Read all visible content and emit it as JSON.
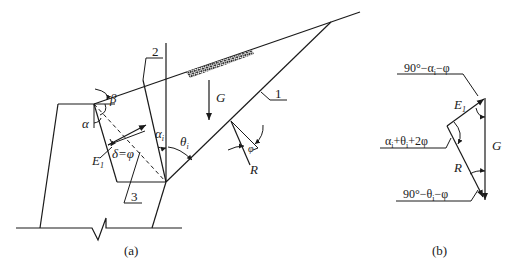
{
  "figure_a": {
    "caption": "(a)",
    "labels": {
      "alpha": "α",
      "beta": "β",
      "alpha_i": "α",
      "alpha_i_sub": "i",
      "theta_i": "θ",
      "theta_i_sub": "i",
      "E1": "E",
      "E1_sub": "1",
      "delta_eq": "δ=φ",
      "G": "G",
      "R": "R",
      "phi": "φ"
    },
    "callouts": {
      "c1": "1",
      "c2": "2",
      "c3": "3"
    }
  },
  "figure_b": {
    "caption": "(b)",
    "labels": {
      "E1": "E",
      "E1_sub": "1",
      "G": "G",
      "R": "R"
    },
    "angles": {
      "top": "90°−α",
      "top_sub": "i",
      "top_tail": "−φ",
      "mid": "α",
      "mid_sub": "i",
      "mid_mid": "+θ",
      "mid_sub2": "i",
      "mid_tail": "+2φ",
      "bottom": "90°−θ",
      "bottom_sub": "i",
      "bottom_tail": "−φ"
    }
  }
}
